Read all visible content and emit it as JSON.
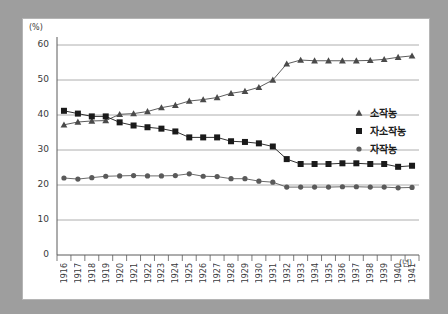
{
  "chart_data": {
    "type": "line",
    "title": "",
    "xlabel": "(년)",
    "ylabel": "(%)",
    "ylim": [
      0,
      60
    ],
    "ytick_values": [
      0,
      10,
      20,
      30,
      40,
      50,
      60
    ],
    "ytick_labels": [
      "0",
      "10",
      "20",
      "30",
      "40",
      "50",
      "60"
    ],
    "grid": true,
    "grid_axis": "y",
    "legend_position": "right-middle",
    "categories": [
      "1916",
      "1917",
      "1918",
      "1919",
      "1920",
      "1921",
      "1922",
      "1923",
      "1924",
      "1925",
      "1926",
      "1927",
      "1928",
      "1929",
      "1930",
      "1931",
      "1932",
      "1933",
      "1934",
      "1935",
      "1936",
      "1937",
      "1938",
      "1939",
      "1940",
      "1941"
    ],
    "series": [
      {
        "name": "소작농",
        "marker": "triangle",
        "color": "#4a4a4a",
        "values": [
          37.2,
          38.0,
          38.3,
          38.4,
          40.2,
          40.4,
          41.0,
          42.1,
          42.8,
          44.0,
          44.4,
          45.0,
          46.2,
          46.8,
          47.9,
          50.0,
          54.6,
          55.7,
          55.5,
          55.5,
          55.5,
          55.5,
          55.6,
          55.9,
          56.5,
          56.9
        ]
      },
      {
        "name": "자소작농",
        "marker": "square",
        "color": "#1a1a1a",
        "values": [
          41.2,
          40.4,
          39.6,
          39.6,
          37.9,
          37.0,
          36.5,
          36.1,
          35.3,
          33.6,
          33.6,
          33.6,
          32.5,
          32.3,
          31.9,
          31.0,
          27.4,
          26.0,
          26.0,
          26.0,
          26.2,
          26.2,
          26.0,
          26.0,
          25.2,
          25.5
        ]
      },
      {
        "name": "자작농",
        "marker": "circle",
        "color": "#5a5a5a",
        "values": [
          22.0,
          21.7,
          22.1,
          22.5,
          22.6,
          22.7,
          22.6,
          22.6,
          22.7,
          23.2,
          22.5,
          22.4,
          21.8,
          21.8,
          21.1,
          20.8,
          19.4,
          19.4,
          19.4,
          19.4,
          19.5,
          19.5,
          19.4,
          19.4,
          19.2,
          19.3
        ]
      }
    ]
  },
  "legend": {
    "items": [
      {
        "label": "소작농"
      },
      {
        "label": "자소작농"
      },
      {
        "label": "자작농"
      }
    ]
  },
  "colors": {
    "panel_background": "#ffffff",
    "page_background": "#9e9e9e",
    "grid": "#9a9a9a",
    "axis": "#5a5a5a",
    "text": "#3a3a3a"
  }
}
